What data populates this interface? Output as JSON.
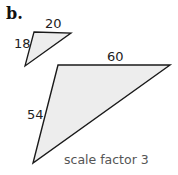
{
  "part_label": "b.",
  "small_triangle": {
    "side_top": "20",
    "side_left": "18",
    "points": "34,32 71,33 25,66"
  },
  "large_triangle": {
    "side_top": "60",
    "side_left": "54",
    "points": "58,65 170,65 33,163"
  },
  "caption": "scale factor 3",
  "colors": {
    "fill": "#ededed",
    "stroke": "#1a1a1a"
  }
}
